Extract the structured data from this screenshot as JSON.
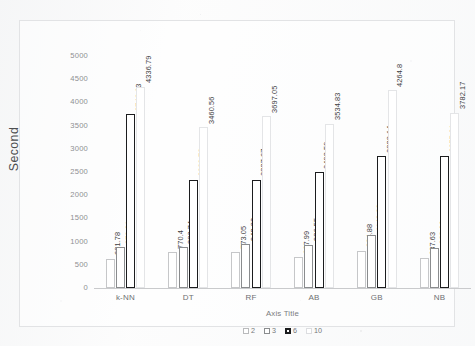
{
  "chart_data": {
    "type": "bar",
    "title": "",
    "subtitle": "",
    "xlabel": "Axis Title",
    "ylabel": "Second",
    "categories": [
      "k-NN",
      "DT",
      "RF",
      "AB",
      "GB",
      "NB"
    ],
    "ylim": [
      0,
      5000
    ],
    "ytick_labels": [
      "5000",
      "4500",
      "4000",
      "3500",
      "3000",
      "2500",
      "2000",
      "1500",
      "1000",
      "500",
      "0"
    ],
    "ytick_values": [
      5000,
      4500,
      4000,
      3500,
      3000,
      2500,
      2000,
      1500,
      1000,
      500,
      0
    ],
    "grid": false,
    "legend_position": "bottom",
    "legend_entries": [
      "2",
      "3",
      "6",
      "10"
    ],
    "series": [
      {
        "name": "2",
        "values": [
          631.78,
          770.4,
          773.05,
          667.99,
          804.88,
          637.63
        ],
        "labels": [
          "631.78",
          "770.4",
          "773.05",
          "667.99",
          "804.88",
          "637.63"
        ],
        "fill": "#ffffff",
        "border": "#c6c7c9"
      },
      {
        "name": "3",
        "values": [
          879.01,
          882.74,
          943.82,
          936.55,
          1148.99,
          868.26
        ],
        "labels": [
          "879.01",
          "882.74",
          "943.82",
          "936.55",
          "1148.99",
          "868.26"
        ],
        "fill": "#ffffff",
        "border": "#8a8c8e"
      },
      {
        "name": "6",
        "values": [
          3746.63,
          2329.76,
          2337.67,
          2493.59,
          2838.14,
          2855.21
        ],
        "labels": [
          "3746.63",
          "2329.76",
          "2337.67",
          "2493.59",
          "2838.14",
          "2855.21"
        ],
        "fill": "#ffffff",
        "border": "#1b1c1e"
      },
      {
        "name": "10",
        "values": [
          4336.79,
          3460.56,
          3697.05,
          3534.83,
          4264.8,
          3782.17
        ],
        "labels": [
          "4336.79",
          "3460.56",
          "3697.05",
          "3534.83",
          "4264.8",
          "3782.17"
        ],
        "fill": "#ffffff",
        "border": "#e4e5e7"
      }
    ]
  }
}
